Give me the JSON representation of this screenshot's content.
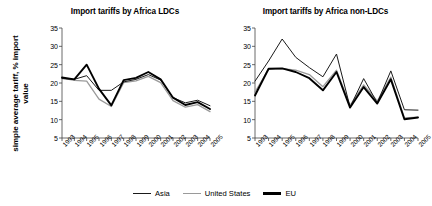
{
  "ylabel": "simple average tariff, % import value",
  "legend": {
    "items": [
      {
        "label": "Asia",
        "color": "#1a1a1a",
        "style": "thin-dark"
      },
      {
        "label": "United States",
        "color": "#9a9a9a",
        "style": "thin-gray"
      },
      {
        "label": "EU",
        "color": "#000000",
        "style": "thick-black"
      }
    ]
  },
  "chart_data": [
    {
      "type": "line",
      "title": "Import tariffs by Africa LDCs",
      "xlabel": "",
      "ylabel": "simple average tariff, % import value",
      "categories": [
        "1993",
        "1994",
        "1995",
        "1996",
        "1997",
        "1998",
        "1999",
        "2000",
        "2001",
        "2002",
        "2003",
        "2004",
        "2005"
      ],
      "ylim": [
        5,
        35
      ],
      "yticks": [
        5,
        10,
        15,
        20,
        25,
        30,
        35
      ],
      "grid": false,
      "legend_position": "bottom",
      "series": [
        {
          "name": "Asia",
          "values": [
            21.2,
            21.0,
            22.0,
            18.0,
            18.0,
            20.3,
            21.0,
            22.3,
            20.8,
            16.0,
            14.6,
            15.3,
            13.8
          ]
        },
        {
          "name": "United States",
          "values": [
            21.3,
            20.7,
            20.5,
            15.6,
            13.6,
            20.1,
            20.6,
            21.8,
            20.1,
            15.2,
            13.4,
            14.1,
            12.2
          ]
        },
        {
          "name": "EU",
          "values": [
            21.5,
            21.0,
            25.0,
            18.4,
            13.9,
            20.8,
            21.4,
            23.0,
            21.0,
            16.0,
            14.0,
            14.8,
            12.9
          ]
        }
      ]
    },
    {
      "type": "line",
      "title": "Import tariffs by Africa non-LDCs",
      "xlabel": "",
      "ylabel": "simple average tariff, % import value",
      "categories": [
        "1993",
        "1994",
        "1995",
        "1996",
        "1997",
        "1998",
        "1999",
        "2000",
        "2001",
        "2002",
        "2003",
        "2004",
        "2005"
      ],
      "ylim": [
        5,
        35
      ],
      "yticks": [
        5,
        10,
        15,
        20,
        25,
        30,
        35
      ],
      "grid": false,
      "legend_position": "bottom",
      "series": [
        {
          "name": "Asia",
          "values": [
            20.5,
            26.0,
            32.0,
            27.0,
            24.2,
            21.7,
            27.9,
            13.4,
            21.2,
            14.6,
            23.3,
            12.7,
            12.6
          ]
        },
        {
          "name": "United States",
          "values": [
            17.5,
            23.7,
            23.9,
            23.5,
            22.3,
            19.0,
            23.5,
            13.9,
            19.5,
            15.1,
            21.6,
            10.5,
            10.7
          ]
        },
        {
          "name": "EU",
          "values": [
            16.6,
            23.9,
            24.0,
            23.0,
            21.3,
            18.0,
            23.0,
            13.3,
            18.9,
            14.4,
            21.0,
            10.1,
            10.6
          ]
        }
      ]
    }
  ]
}
